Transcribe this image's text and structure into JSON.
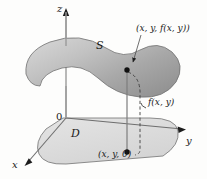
{
  "figure": {
    "kind": "3d-surface-over-domain-diagram",
    "background_color": "#fdfdfc",
    "axes": {
      "z_label": "z",
      "y_label": "y",
      "x_label": "x",
      "origin_label": "0"
    },
    "surface": {
      "label": "S",
      "fill_light": "#cfcfcf",
      "fill_dark": "#959595",
      "stroke": "#6f6f6f"
    },
    "domain": {
      "label": "D",
      "fill": "#dedede",
      "stroke": "#7a7a7a"
    },
    "points": {
      "surface_point_label": "(x, y, f(x, y))",
      "base_point_label": "(x, y, 0)",
      "point_color": "#111111"
    },
    "height_label": "f(x, y)",
    "line_color": "#8a8a8a",
    "dash_color": "#4a4a4a"
  }
}
